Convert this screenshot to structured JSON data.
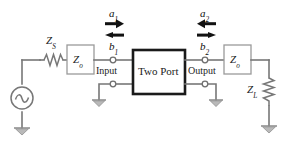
{
  "diagram": {
    "background_color": "#ffffff",
    "wire_color": "#777777",
    "box_border_color": "#1a1a1a",
    "arrow_color": "#121212"
  },
  "labels": {
    "source_impedance": "Z",
    "source_impedance_sub": "S",
    "input_ref_impedance": "Z",
    "input_ref_impedance_sub": "o",
    "output_ref_impedance": "Z",
    "output_ref_impedance_sub": "o",
    "load_impedance": "Z",
    "load_impedance_sub": "L",
    "two_port": "Two Port",
    "input_port": "Input",
    "output_port": "Output",
    "a1": "a",
    "a1_sub": "1",
    "b1": "b",
    "b1_sub": "1",
    "a2": "a",
    "a2_sub": "2",
    "b2": "b",
    "b2_sub": "2"
  },
  "elements": {
    "ac_source": "ac-voltage-source",
    "series_resistor": "resistor-zs",
    "load_resistor": "resistor-zl",
    "ground_count": 4,
    "arrow_a1_direction": "right",
    "arrow_b1_direction": "left",
    "arrow_a2_direction": "left",
    "arrow_b2_direction": "right"
  }
}
